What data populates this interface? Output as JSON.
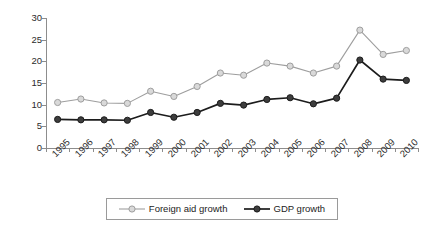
{
  "chart_data": {
    "type": "line",
    "title": "",
    "xlabel": "",
    "ylabel": "",
    "grid": false,
    "legend_position": "bottom-center",
    "ylim": [
      0,
      30
    ],
    "yticks": [
      0,
      5,
      10,
      15,
      20,
      25,
      30
    ],
    "categories": [
      "1995",
      "1996",
      "1997",
      "1998",
      "1999",
      "2000",
      "2001",
      "2002",
      "2003",
      "2004",
      "2005",
      "2006",
      "2007",
      "2008",
      "2009",
      "2010"
    ],
    "series": [
      {
        "name": "Foreign aid growth",
        "marker": "open-circle",
        "color": "#9e9e9e",
        "marker_fill": "#d9d9d9",
        "values": [
          10.5,
          11.3,
          10.4,
          10.3,
          13.1,
          11.9,
          14.2,
          17.3,
          16.8,
          19.6,
          18.9,
          17.3,
          18.9,
          27.2,
          21.6,
          22.5
        ]
      },
      {
        "name": "GDP growth",
        "marker": "filled-circle",
        "color": "#1c1c1c",
        "marker_fill": "#3d3d3d",
        "values": [
          6.6,
          6.5,
          6.5,
          6.4,
          8.2,
          7.1,
          8.2,
          10.3,
          9.9,
          11.2,
          11.6,
          10.2,
          11.5,
          20.3,
          15.9,
          15.6
        ]
      }
    ]
  },
  "legend": {
    "items": [
      {
        "label": "Foreign aid growth"
      },
      {
        "label": "GDP growth"
      }
    ]
  },
  "axes": {
    "y_tick_labels": [
      "0",
      "5",
      "10",
      "15",
      "20",
      "25",
      "30"
    ],
    "x_tick_labels": [
      "1995",
      "1996",
      "1997",
      "1998",
      "1999",
      "2000",
      "2001",
      "2002",
      "2003",
      "2004",
      "2005",
      "2006",
      "2007",
      "2008",
      "2009",
      "2010"
    ]
  }
}
